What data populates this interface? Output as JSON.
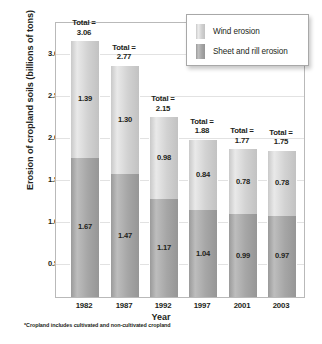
{
  "chart_data": {
    "type": "bar",
    "subtype": "stacked-bar",
    "title": "",
    "xlabel": "Year",
    "ylabel": "Erosion of cropland soils (billions of tons)",
    "categories": [
      "1982",
      "1987",
      "1992",
      "1997",
      "2001",
      "2003"
    ],
    "series": [
      {
        "name": "Wind erosion",
        "color": "#d2d2d2",
        "values": [
          1.39,
          1.3,
          0.98,
          0.84,
          0.78,
          0.78
        ],
        "value_labels": [
          "1.39",
          "1.30",
          "0.98",
          "0.84",
          "0.78",
          "0.78"
        ]
      },
      {
        "name": "Sheet and rill erosion",
        "color": "#a6a6a6",
        "values": [
          1.67,
          1.47,
          1.17,
          1.04,
          0.99,
          0.97
        ],
        "value_labels": [
          "1.67",
          "1.47",
          "1.17",
          "1.04",
          "0.99",
          "0.97"
        ]
      }
    ],
    "totals": [
      3.06,
      2.77,
      2.15,
      1.88,
      1.77,
      1.75
    ],
    "total_labels": [
      "3.06",
      "2.77",
      "2.15",
      "1.88",
      "1.77",
      "1.75"
    ],
    "total_prefix": "Total =",
    "ylim": [
      0,
      3.28
    ],
    "yticks": [
      0.5,
      1.0,
      1.5,
      2.0,
      2.5,
      3.0
    ],
    "ytick_labels": [
      "0.50",
      "1.00",
      "1.50",
      "2.00",
      "2.50",
      "3.00"
    ],
    "grid": true,
    "grid_axis": "y",
    "legend_position": "top-right",
    "footnote": "*Cropland includes cultivated and non-cultivated cropland"
  }
}
